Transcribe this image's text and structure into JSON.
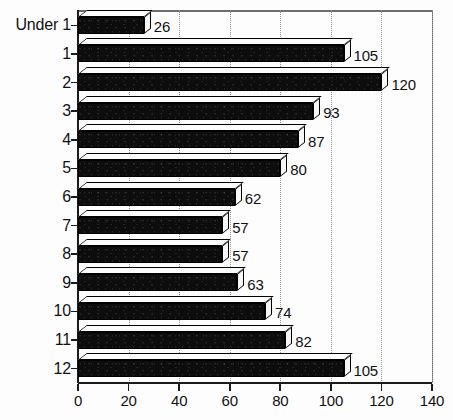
{
  "chart_data": {
    "type": "bar",
    "orientation": "horizontal",
    "title": "",
    "xlabel": "",
    "ylabel": "",
    "xlim": [
      0,
      140
    ],
    "xticks": [
      0,
      20,
      40,
      60,
      80,
      100,
      120,
      140
    ],
    "xtick_labels": [
      "0",
      "20",
      "40",
      "60",
      "80",
      "100",
      "120",
      "140"
    ],
    "grid": "vertical-dotted",
    "legend": "none",
    "categories": [
      "Under 1",
      "1",
      "2",
      "3",
      "4",
      "5",
      "6",
      "7",
      "8",
      "9",
      "10",
      "11",
      "12"
    ],
    "values": [
      26,
      105,
      120,
      93,
      87,
      80,
      62,
      57,
      57,
      63,
      74,
      82,
      105
    ],
    "data_labels": [
      "26",
      "105",
      "120",
      "93",
      "87",
      "80",
      "62",
      "57",
      "57",
      "63",
      "74",
      "82",
      "105"
    ],
    "bar_color": "#0d0d0d",
    "bar_style": "3d-block",
    "axis_color": "#1a1a1a",
    "gridline_color": "#9a9a9a",
    "frame_color": "#6e6e6e",
    "background": "#ffffff"
  }
}
